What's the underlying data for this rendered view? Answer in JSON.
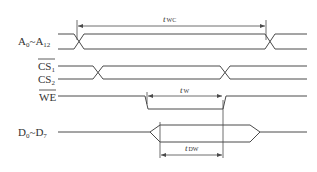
{
  "diagram": {
    "type": "write-cycle timing diagram",
    "signals": [
      {
        "id": "addr",
        "name": "A",
        "from_sub": "0",
        "sep": "~",
        "to_name": "A",
        "to_sub": "12",
        "overline": false
      },
      {
        "id": "cs1",
        "name": "CS",
        "sub": "1",
        "overline": true
      },
      {
        "id": "cs2",
        "name": "CS",
        "sub": "2",
        "overline": false
      },
      {
        "id": "we",
        "name": "WE",
        "overline": true
      },
      {
        "id": "data",
        "name": "D",
        "from_sub": "0",
        "sep": "~",
        "to_name": "D",
        "to_sub": "7",
        "overline": false
      }
    ],
    "timings": [
      {
        "id": "twc",
        "t": "t",
        "sub": "WC"
      },
      {
        "id": "tw",
        "t": "t",
        "sub": "W"
      },
      {
        "id": "tdw",
        "t": "t",
        "sub": "DW"
      }
    ]
  }
}
